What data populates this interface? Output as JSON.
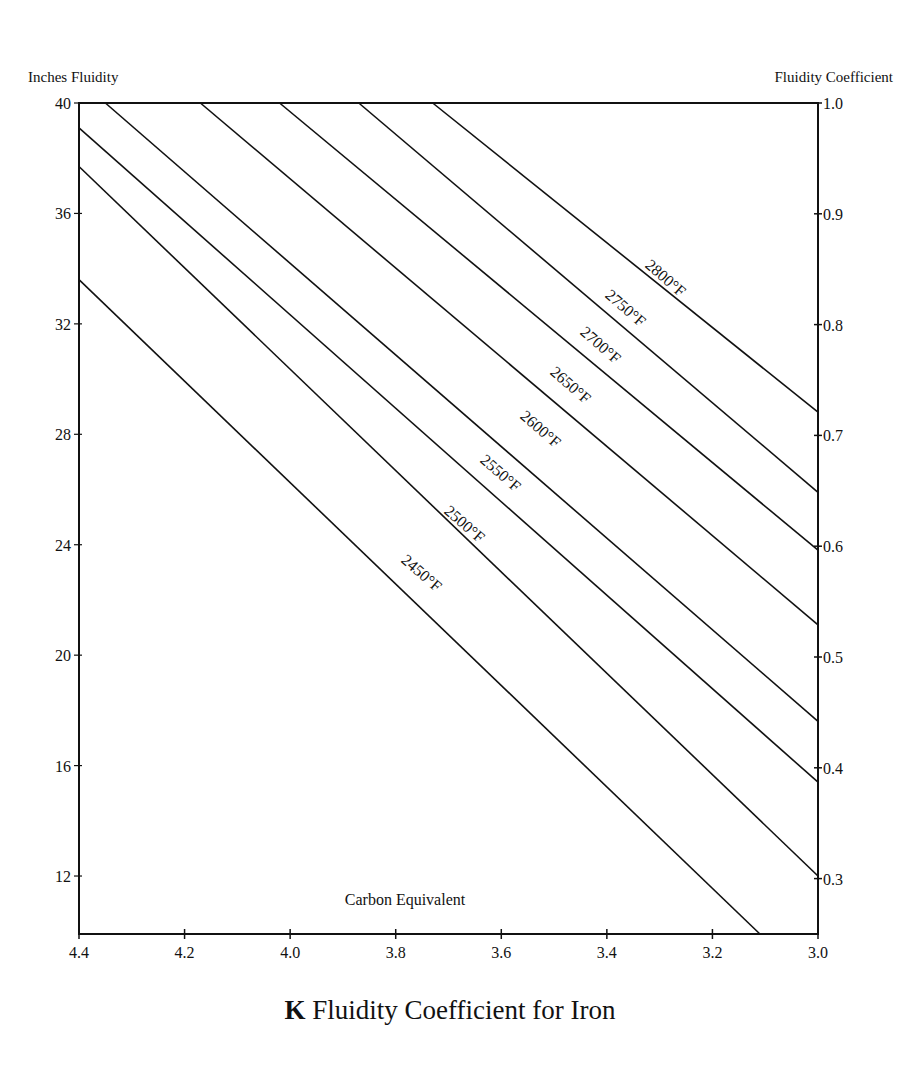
{
  "chart_data": {
    "type": "line",
    "title": "K Fluidity Coefficient for Iron",
    "title_prefix": "K",
    "title_rest": "Fluidity Coefficient for Iron",
    "xlabel": "Carbon Equivalent",
    "ylabel": "Inches Fluidity",
    "ylabel_right": "Fluidity Coefficient",
    "xlim": [
      4.4,
      3.0
    ],
    "x_reversed": true,
    "ylim": [
      9.9,
      40
    ],
    "ylim_right": [
      0.25,
      1.0
    ],
    "grid": false,
    "legend": "inline labels on lines",
    "x_ticks": [
      "4.4",
      "4.2",
      "4.0",
      "3.8",
      "3.6",
      "3.4",
      "3.2",
      "3.0"
    ],
    "y_ticks": [
      "40",
      "36",
      "32",
      "28",
      "24",
      "20",
      "16",
      "12"
    ],
    "y_right_ticks": [
      "1.0",
      "0.9",
      "0.8",
      "0.7",
      "0.6",
      "0.5",
      "0.4",
      "0.3"
    ],
    "series": [
      {
        "name": "2450°F",
        "x": [
          4.4,
          3.11
        ],
        "y": [
          33.6,
          9.9
        ]
      },
      {
        "name": "2500°F",
        "x": [
          4.4,
          3.0
        ],
        "y": [
          37.7,
          12.0
        ]
      },
      {
        "name": "2550°F",
        "x": [
          4.4,
          3.0
        ],
        "y": [
          39.1,
          15.4
        ]
      },
      {
        "name": "2600°F",
        "x": [
          4.35,
          3.0
        ],
        "y": [
          40.0,
          17.6
        ]
      },
      {
        "name": "2650°F",
        "x": [
          4.17,
          3.0
        ],
        "y": [
          40.0,
          21.1
        ]
      },
      {
        "name": "2700°F",
        "x": [
          4.02,
          3.0
        ],
        "y": [
          40.0,
          23.8
        ]
      },
      {
        "name": "2750°F",
        "x": [
          3.87,
          3.0
        ],
        "y": [
          40.0,
          25.9
        ]
      },
      {
        "name": "2800°F",
        "x": [
          3.73,
          3.0
        ],
        "y": [
          40.0,
          28.8
        ]
      }
    ]
  },
  "labels": {
    "y_left_title": "Inches Fluidity",
    "y_right_title": "Fluidity Coefficient",
    "x_title": "Carbon Equivalent",
    "caption_prefix": "K",
    "caption_rest": "Fluidity Coefficient for Iron"
  },
  "line_labels": [
    {
      "text": "2450°F",
      "x": 418,
      "y": 577
    },
    {
      "text": "2500°F",
      "x": 461,
      "y": 528
    },
    {
      "text": "2550°F",
      "x": 497,
      "y": 477
    },
    {
      "text": "2600°F",
      "x": 537,
      "y": 433
    },
    {
      "text": "2650°F",
      "x": 567,
      "y": 389
    },
    {
      "text": "2700°F",
      "x": 597,
      "y": 349
    },
    {
      "text": "2750°F",
      "x": 622,
      "y": 312
    },
    {
      "text": "2800°F",
      "x": 662,
      "y": 282
    }
  ],
  "colors": {
    "ink": "#111111",
    "background": "#ffffff"
  }
}
